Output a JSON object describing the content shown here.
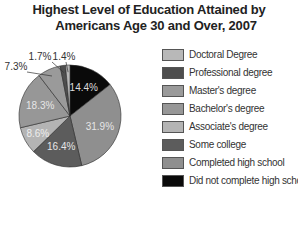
{
  "chart_data": {
    "type": "pie",
    "title": "Highest Level of Education Attained by Americans Age 30 and Over, 2007",
    "title_lines": [
      "Highest Level of Education Attained by",
      "Americans Age 30 and Over, 2007"
    ],
    "legend_position": "right",
    "start_angle_deg": 0,
    "direction": "clockwise",
    "slices": [
      {
        "label": "Did not complete high school",
        "value": 14.4,
        "display": "14.4%",
        "color": "#0a0a0a",
        "text_color": "#dddddd"
      },
      {
        "label": "Completed high school",
        "value": 31.9,
        "display": "31.9%",
        "color": "#8f8f8f",
        "text_color": "#e6e6e6"
      },
      {
        "label": "Some college",
        "value": 16.4,
        "display": "16.4%",
        "color": "#5c5c5c",
        "text_color": "#e6e6e6"
      },
      {
        "label": "Associate's degree",
        "value": 8.6,
        "display": "8.6%",
        "color": "#b4b4b4",
        "text_color": "#eeeeee"
      },
      {
        "label": "Bachelor's degree",
        "value": 18.3,
        "display": "18.3%",
        "color": "#979797",
        "text_color": "#e6e6e6"
      },
      {
        "label": "Master's degree",
        "value": 7.3,
        "display": "7.3%",
        "color": "#9a9a9a",
        "text_color": "#333333"
      },
      {
        "label": "Professional degree",
        "value": 1.7,
        "display": "1.7%",
        "color": "#4e4e4e",
        "text_color": "#333333"
      },
      {
        "label": "Doctoral Degree",
        "value": 1.4,
        "display": "1.4%",
        "color": "#b8b8b8",
        "text_color": "#333333"
      }
    ],
    "legend": [
      {
        "label": "Doctoral Degree",
        "color": "#b8b8b8"
      },
      {
        "label": "Professional degree",
        "color": "#4e4e4e"
      },
      {
        "label": "Master's degree",
        "color": "#9a9a9a"
      },
      {
        "label": "Bachelor's degree",
        "color": "#979797"
      },
      {
        "label": "Associate's degree",
        "color": "#b4b4b4"
      },
      {
        "label": "Some college",
        "color": "#5c5c5c"
      },
      {
        "label": "Completed high school",
        "color": "#8f8f8f"
      },
      {
        "label": "Did not complete high school",
        "color": "#0a0a0a"
      }
    ]
  }
}
